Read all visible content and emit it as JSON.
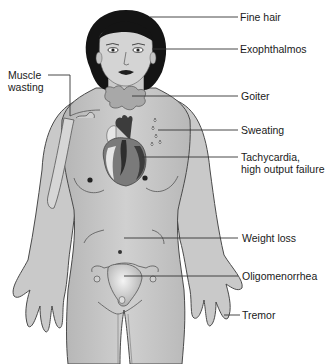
{
  "figure": {
    "colors": {
      "background": "#ffffff",
      "skin": "#c8c8c8",
      "outline": "#4a4a4a",
      "hair": "#141414",
      "goiter": "#a8a8a8",
      "heart_dark": "#3c3c3c",
      "heart_mid": "#7a7a7a",
      "heart_light": "#e6e6e6",
      "leader_line": "#333333",
      "text": "#1a1a1a"
    }
  },
  "labels": [
    {
      "id": "fine-hair",
      "text": "Fine hair"
    },
    {
      "id": "exophthalmos",
      "text": "Exophthalmos"
    },
    {
      "id": "muscle-wasting",
      "text": "Muscle\nwasting"
    },
    {
      "id": "goiter",
      "text": "Goiter"
    },
    {
      "id": "sweating",
      "text": "Sweating"
    },
    {
      "id": "tachycardia",
      "text": "Tachycardia,\nhigh output failure"
    },
    {
      "id": "weight-loss",
      "text": "Weight loss"
    },
    {
      "id": "oligomenorrhea",
      "text": "Oligomenorrhea"
    },
    {
      "id": "tremor",
      "text": "Tremor"
    }
  ]
}
